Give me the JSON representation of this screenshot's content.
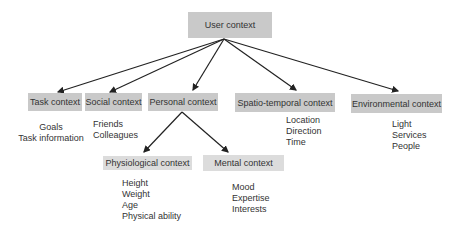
{
  "nodes": {
    "user": "User context",
    "task": "Task context",
    "social": "Social context",
    "personal": "Personal context",
    "spatio": "Spatio-temporal context",
    "environmental": "Environmental  context",
    "physiological": "Physiological context",
    "mental": "Mental context"
  },
  "attributes": {
    "task": [
      "Goals",
      "Task information"
    ],
    "social": [
      "Friends",
      "Colleagues"
    ],
    "spatio": [
      "Location",
      "Direction",
      "Time"
    ],
    "environmental": [
      "Light",
      "Services",
      "People"
    ],
    "physiological": [
      "Height",
      "Weight",
      "Age",
      "Physical ability"
    ],
    "mental": [
      "Mood",
      "Expertise",
      "Interests"
    ]
  },
  "colors": {
    "box": "#c9c9c9",
    "box_light": "#dcdcdc",
    "arrow": "#222222"
  }
}
